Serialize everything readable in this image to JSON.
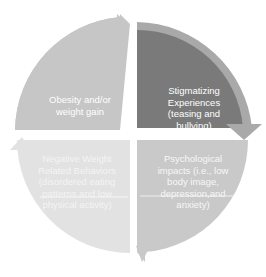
{
  "diagram": {
    "type": "cycle",
    "colors": {
      "top_left": "#c6c6c6",
      "top_right_inner": "#7a7a7a",
      "top_right_arrow": "#a9a9a9",
      "bottom_left": "#e2e2e2",
      "bottom_right": "#c9c9c9",
      "text": "#ffffff"
    },
    "segments": [
      {
        "position": "top-left",
        "lines": [
          "Obesity and/or",
          "weight gain"
        ]
      },
      {
        "position": "top-right",
        "lines": [
          "Stigmatizing",
          "Experiences",
          "(teasing and",
          "bullying)"
        ]
      },
      {
        "position": "bottom-right",
        "lines": [
          "Psychological",
          "impacts (i.e., low",
          "body image,",
          "depression,and",
          "anxiety)"
        ]
      },
      {
        "position": "bottom-left",
        "lines": [
          "Negative Weight",
          "Related Behaviors",
          "(disordered eating",
          "patterns and low",
          "physical activity)"
        ]
      }
    ]
  }
}
